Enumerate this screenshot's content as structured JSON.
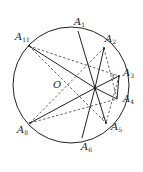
{
  "diagram": {
    "type": "circle-chords-geometry",
    "colors": {
      "stroke": "#222222",
      "background": "#ffffff"
    },
    "circle": {
      "cx": 71,
      "cy": 85,
      "r": 58
    },
    "center_label": "O",
    "center_label_pos": {
      "x": 53,
      "y": 88
    },
    "intersection_point": {
      "x": 95,
      "y": 88
    },
    "points": [
      {
        "id": "A1",
        "letter": "A",
        "sub": "1",
        "x": 78,
        "y": 31,
        "lx": 74,
        "ly": 25
      },
      {
        "id": "A2",
        "letter": "A",
        "sub": "2",
        "x": 104,
        "y": 48,
        "lx": 105,
        "ly": 42
      },
      {
        "id": "A3",
        "letter": "A",
        "sub": "3",
        "x": 119,
        "y": 76,
        "lx": 123,
        "ly": 76
      },
      {
        "id": "A4",
        "letter": "A",
        "sub": "4",
        "x": 117,
        "y": 99,
        "lx": 123,
        "ly": 102
      },
      {
        "id": "A5",
        "letter": "A",
        "sub": "5",
        "x": 106,
        "y": 123,
        "lx": 111,
        "ly": 130
      },
      {
        "id": "A6",
        "letter": "A",
        "sub": "6",
        "x": 82,
        "y": 138,
        "lx": 81,
        "ly": 150
      },
      {
        "id": "A8",
        "letter": "A",
        "sub": "8",
        "x": 30,
        "y": 123,
        "lx": 17,
        "ly": 133
      },
      {
        "id": "A11",
        "letter": "A",
        "sub": "11",
        "x": 29,
        "y": 46,
        "lx": 15,
        "ly": 40
      }
    ],
    "solid_segments": [
      [
        "A1",
        "P"
      ],
      [
        "P",
        "A6"
      ],
      [
        "A11",
        "P"
      ],
      [
        "P",
        "A4"
      ],
      [
        "A8",
        "P"
      ],
      [
        "P",
        "A3"
      ],
      [
        "A2",
        "P"
      ],
      [
        "P",
        "A5"
      ],
      [
        "A3",
        "A4"
      ]
    ],
    "dashed_segments": [
      [
        "A11",
        "A3"
      ],
      [
        "A11",
        "A5"
      ],
      [
        "A8",
        "A2"
      ],
      [
        "A8",
        "A4"
      ],
      [
        "A2",
        "A4"
      ],
      [
        "A3",
        "A5"
      ]
    ],
    "angle_marks": [
      {
        "at": "A3",
        "label": "angle-at-A3"
      },
      {
        "at": "A5",
        "label": "angle-at-A5"
      }
    ]
  }
}
